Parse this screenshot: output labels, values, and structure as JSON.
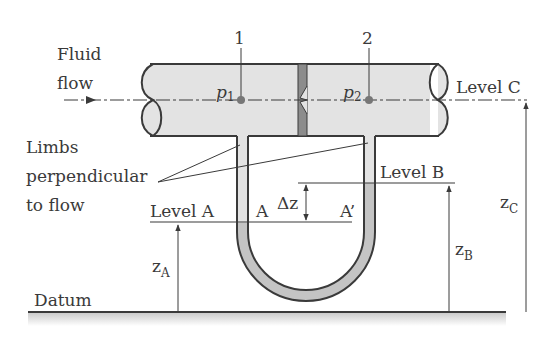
{
  "figure": {
    "type": "differential manometer across orifice plate",
    "colors": {
      "stroke": "#3a3a3a",
      "pipe_fill": "#e3e3e3",
      "manometer_fluid": "#c4c4c4",
      "orifice_plate": "#8c8c8c",
      "ground_shade": "#d0d0d0",
      "background": "#ffffff"
    }
  },
  "labels": {
    "fluid_flow_line1": "Fluid",
    "fluid_flow_line2": "flow",
    "section_1": "1",
    "section_2": "2",
    "p1_main": "p",
    "p1_sub": "1",
    "p2_main": "p",
    "p2_sub": "2",
    "level_c": "Level C",
    "limbs_line1": "Limbs",
    "limbs_line2": "perpendicular",
    "limbs_line3": "to flow",
    "level_b": "Level B",
    "level_a": "Level A",
    "point_a": "A",
    "point_a_prime": "A’",
    "delta_z": "Δz",
    "z_a_main": "z",
    "z_a_sub": "A",
    "z_b_main": "z",
    "z_b_sub": "B",
    "z_c_main": "z",
    "z_c_sub": "C",
    "datum": "Datum"
  }
}
